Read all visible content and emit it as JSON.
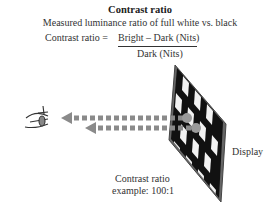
{
  "title": "Contrast ratio",
  "subtitle": "Measured luminance ratio of full white vs. black",
  "formula": {
    "lhs": "Contrast ratio =",
    "numerator": "Bright – Dark (Nits)",
    "denominator": "Dark (Nits)"
  },
  "labels": {
    "display": "Display",
    "example_line1": "Contrast ratio",
    "example_line2": "example: 100:1"
  },
  "icons": {
    "eye": "eye-icon",
    "arrow": "dashed-arrow-left"
  },
  "colors": {
    "arrow": "#8a8a8a",
    "panel": "#111111",
    "frame": "#555555",
    "text": "#333333"
  }
}
